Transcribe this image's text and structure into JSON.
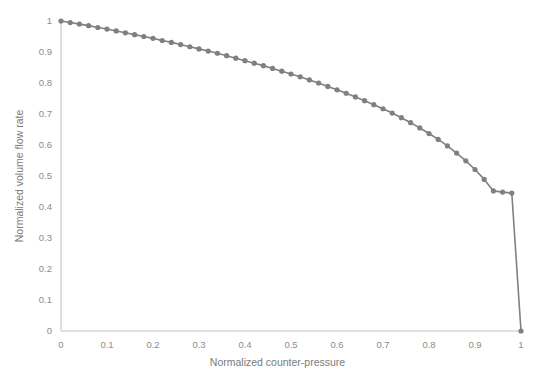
{
  "chart_data": {
    "type": "line",
    "title": "",
    "subtitle": "",
    "xlabel": "Normalized counter-pressure",
    "ylabel": "Normalized volume flow rate",
    "xlim": [
      0,
      1
    ],
    "ylim": [
      0,
      1
    ],
    "grid": false,
    "legend": false,
    "legend_position": "none",
    "marker": "circle",
    "line_color": "#808080",
    "marker_color": "#808080",
    "axis_color": "#bfbfbf",
    "tick_label_color": "#8c8c8c",
    "axis_title_color": "#7a7a7a",
    "background_color": "#ffffff",
    "xticks": [
      "0",
      "0.1",
      "0.2",
      "0.3",
      "0.4",
      "0.5",
      "0.6",
      "0.7",
      "0.8",
      "0.9",
      "1"
    ],
    "xtick_values": [
      0,
      0.1,
      0.2,
      0.3,
      0.4,
      0.5,
      0.6,
      0.7,
      0.8,
      0.9,
      1
    ],
    "yticks": [
      "0",
      "0.1",
      "0.2",
      "0.3",
      "0.4",
      "0.5",
      "0.6",
      "0.7",
      "0.8",
      "0.9",
      "1"
    ],
    "ytick_values": [
      0,
      0.1,
      0.2,
      0.3,
      0.4,
      0.5,
      0.6,
      0.7,
      0.8,
      0.9,
      1
    ],
    "series": [
      {
        "name": "Normalized volume flow rate",
        "x": [
          0,
          0.02,
          0.04,
          0.06,
          0.08,
          0.1,
          0.12,
          0.14,
          0.16,
          0.18,
          0.2,
          0.22,
          0.24,
          0.26,
          0.28,
          0.3,
          0.32,
          0.34,
          0.36,
          0.38,
          0.4,
          0.42,
          0.44,
          0.46,
          0.48,
          0.5,
          0.52,
          0.54,
          0.56,
          0.58,
          0.6,
          0.62,
          0.64,
          0.66,
          0.68,
          0.7,
          0.72,
          0.74,
          0.76,
          0.78,
          0.8,
          0.82,
          0.84,
          0.86,
          0.88,
          0.9,
          0.92,
          0.94,
          0.96,
          0.98,
          1.0
        ],
        "values": [
          1.0,
          0.995,
          0.99,
          0.985,
          0.979,
          0.974,
          0.968,
          0.962,
          0.956,
          0.95,
          0.944,
          0.937,
          0.931,
          0.924,
          0.917,
          0.91,
          0.903,
          0.896,
          0.888,
          0.88,
          0.872,
          0.864,
          0.856,
          0.847,
          0.838,
          0.829,
          0.82,
          0.81,
          0.8,
          0.789,
          0.778,
          0.767,
          0.755,
          0.743,
          0.73,
          0.717,
          0.703,
          0.688,
          0.672,
          0.655,
          0.637,
          0.618,
          0.597,
          0.574,
          0.549,
          0.521,
          0.489,
          0.452,
          0.448,
          0.445,
          0.0
        ]
      }
    ],
    "annotations": []
  }
}
